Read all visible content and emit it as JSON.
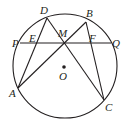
{
  "diagram": {
    "type": "geometry-circle",
    "center_label": "O",
    "points": {
      "A": "A",
      "B": "B",
      "C": "C",
      "D": "D",
      "E": "E",
      "F": "F",
      "M": "M",
      "P": "P",
      "Q": "Q"
    },
    "segments": [
      [
        "D",
        "A"
      ],
      [
        "D",
        "C"
      ],
      [
        "A",
        "B"
      ],
      [
        "B",
        "C"
      ],
      [
        "P",
        "Q"
      ]
    ],
    "colors": {
      "ink": "#231f20",
      "background": "#ffffff"
    }
  }
}
